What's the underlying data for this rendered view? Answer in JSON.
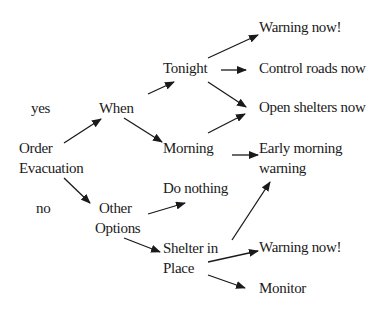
{
  "diagram": {
    "type": "decision-tree",
    "nodes": {
      "yes": "yes",
      "no": "no",
      "order_line1": "Order",
      "order_line2": "Evacuation",
      "when": "When",
      "other_line1": "Other",
      "other_line2": "Options",
      "tonight": "Tonight",
      "morning": "Morning",
      "do_nothing": "Do nothing",
      "shelter_line1": "Shelter in",
      "shelter_line2": "Place",
      "warning_now_1": "Warning now!",
      "control_roads": "Control roads now",
      "open_shelters": "Open shelters now",
      "early_line1": "Early morning",
      "early_line2": "warning",
      "warning_now_2": "Warning now!",
      "monitor": "Monitor"
    },
    "edges": [
      {
        "from": "Order Evacuation",
        "to": "When",
        "label": "yes"
      },
      {
        "from": "Order Evacuation",
        "to": "Other Options",
        "label": "no"
      },
      {
        "from": "When",
        "to": "Tonight"
      },
      {
        "from": "When",
        "to": "Morning"
      },
      {
        "from": "Tonight",
        "to": "Warning now!"
      },
      {
        "from": "Tonight",
        "to": "Control roads now"
      },
      {
        "from": "Tonight",
        "to": "Open shelters now"
      },
      {
        "from": "Morning",
        "to": "Open shelters now"
      },
      {
        "from": "Morning",
        "to": "Early morning warning"
      },
      {
        "from": "Other Options",
        "to": "Do nothing"
      },
      {
        "from": "Other Options",
        "to": "Shelter in Place"
      },
      {
        "from": "Shelter in Place",
        "to": "Early morning warning"
      },
      {
        "from": "Shelter in Place",
        "to": "Warning now!"
      },
      {
        "from": "Shelter in Place",
        "to": "Monitor"
      }
    ],
    "colors": {
      "text": "#1a1a1a",
      "arrow": "#1a1a1a",
      "background": "#ffffff"
    }
  }
}
